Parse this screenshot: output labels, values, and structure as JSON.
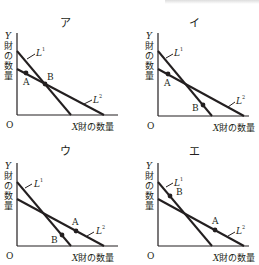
{
  "header_residue": "",
  "axes": {
    "origin": "O",
    "y_var": "Y",
    "y_rest": [
      "財",
      "の",
      "数",
      "量"
    ],
    "x_var": "X",
    "x_rest": "財の数量"
  },
  "lines": {
    "l1": {
      "base": "L",
      "sup": "1"
    },
    "l2": {
      "base": "L",
      "sup": "2"
    }
  },
  "panels": [
    {
      "title": "ア",
      "pointA_label": "A",
      "pointB_label": "B",
      "pointA_position": "on L2, left of intersection",
      "pointB_position": "at intersection of L1 and L2"
    },
    {
      "title": "イ",
      "pointA_label": "A",
      "pointB_label": "B",
      "pointA_position": "on L2, left of intersection",
      "pointB_position": "on L1, right of intersection"
    },
    {
      "title": "ウ",
      "pointA_label": "A",
      "pointB_label": "B",
      "pointA_position": "on L2, right of intersection",
      "pointB_position": "on L1, right of intersection"
    },
    {
      "title": "エ",
      "pointA_label": "A",
      "pointB_label": "B",
      "pointA_position": "on L2, right of intersection",
      "pointB_position": "on L1, left of intersection"
    }
  ]
}
